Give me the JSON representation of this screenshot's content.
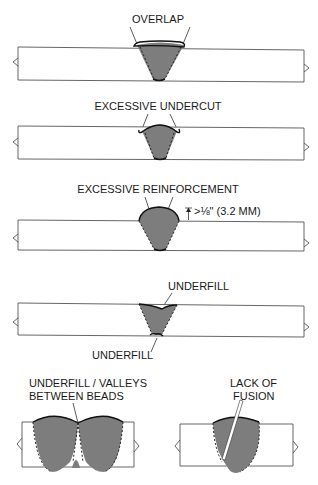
{
  "diagram": {
    "panels": [
      {
        "id": "overlap",
        "labels": [
          "OVERLAP"
        ]
      },
      {
        "id": "excessive-undercut",
        "labels": [
          "EXCESSIVE UNDERCUT"
        ]
      },
      {
        "id": "excessive-reinforcement",
        "labels": [
          "EXCESSIVE REINFORCEMENT"
        ],
        "dimension": ">⅛\" (3.2 MM)"
      },
      {
        "id": "underfill",
        "labels": [
          "UNDERFILL",
          "UNDERFILL"
        ]
      },
      {
        "id": "underfill-valleys",
        "labels": [
          "UNDERFILL / VALLEYS",
          "BETWEEN BEADS"
        ]
      },
      {
        "id": "lack-of-fusion",
        "labels": [
          "LACK OF",
          "FUSION"
        ]
      }
    ],
    "colors": {
      "weld_fill": "#7d7d7d",
      "outline": "#111111",
      "plate_edge": "#555555"
    }
  }
}
